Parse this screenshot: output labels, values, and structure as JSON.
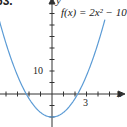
{
  "problem_number": "63.",
  "function_label": "f(x) = 2x² − 10",
  "chart_data": {
    "type": "line",
    "xlabel": "x",
    "ylabel": "y",
    "x_tick_labels": [
      {
        "value": 3,
        "label": "3"
      }
    ],
    "y_tick_labels": [
      {
        "value": 10,
        "label": "10"
      }
    ],
    "x_tick_step": 1,
    "y_tick_step": 5,
    "xlim": [
      -4.5,
      6
    ],
    "ylim": [
      -13,
      40
    ],
    "series": [
      {
        "name": "f(x) = 2x^2 - 10",
        "color": "#5b9bd5",
        "x": [
          -4,
          -3,
          -2,
          -1,
          0,
          1,
          2,
          3,
          4
        ],
        "y": [
          22,
          8,
          -2,
          -8,
          -10,
          -8,
          -2,
          8,
          22
        ]
      }
    ],
    "vertex": [
      0,
      -10
    ],
    "x_intercepts": [
      -2.236,
      2.236
    ],
    "grid": false
  },
  "labels": {
    "x_axis": "x",
    "y_axis": "y",
    "tick_10": "10",
    "tick_3": "3"
  }
}
